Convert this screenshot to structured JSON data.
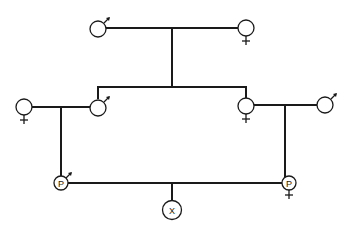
{
  "diagram": {
    "type": "pedigree",
    "generations": [
      {
        "level": 1,
        "individuals": [
          {
            "id": "gp-male",
            "sex": "male",
            "label": ""
          },
          {
            "id": "gp-female",
            "sex": "female",
            "label": ""
          }
        ]
      },
      {
        "level": 2,
        "individuals": [
          {
            "id": "in-law-female",
            "sex": "female",
            "label": ""
          },
          {
            "id": "son",
            "sex": "male",
            "label": ""
          },
          {
            "id": "daughter",
            "sex": "female",
            "label": ""
          },
          {
            "id": "in-law-male",
            "sex": "male",
            "label": ""
          }
        ]
      },
      {
        "level": 3,
        "individuals": [
          {
            "id": "parent-male",
            "sex": "male",
            "label": "P"
          },
          {
            "id": "parent-female",
            "sex": "female",
            "label": "P"
          }
        ]
      },
      {
        "level": 4,
        "individuals": [
          {
            "id": "offspring",
            "sex": "unknown",
            "label": "X"
          }
        ]
      }
    ],
    "labels": {
      "parent_male": "P",
      "parent_female": "P",
      "offspring": "X"
    }
  }
}
